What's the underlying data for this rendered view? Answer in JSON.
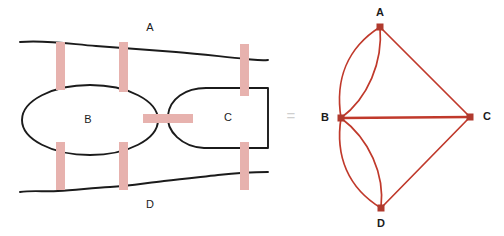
{
  "figure": {
    "equals_symbol": "=",
    "background_color": "#ffffff"
  },
  "map": {
    "name": "konigsberg-land-map",
    "land_color": "#ffffff",
    "shore_color": "#1b1b1b",
    "bridge_color": "#e7b2ae",
    "regions": [
      {
        "id": "A",
        "label": "A",
        "label_x": 150,
        "label_y": 28,
        "kind": "north-bank"
      },
      {
        "id": "B",
        "label": "B",
        "label_x": 88,
        "label_y": 120,
        "kind": "island-ellipse"
      },
      {
        "id": "C",
        "label": "C",
        "label_x": 228,
        "label_y": 118,
        "kind": "east-region"
      },
      {
        "id": "D",
        "label": "D",
        "label_x": 150,
        "label_y": 205,
        "kind": "south-bank"
      }
    ],
    "bridges": [
      {
        "id": "bridge-1",
        "connects": [
          "A",
          "B"
        ],
        "orientation": "vertical",
        "x": 56,
        "y": 42,
        "w": 9,
        "h": 48
      },
      {
        "id": "bridge-2",
        "connects": [
          "A",
          "B"
        ],
        "orientation": "vertical",
        "x": 119,
        "y": 42,
        "w": 9,
        "h": 50
      },
      {
        "id": "bridge-3",
        "connects": [
          "A",
          "C"
        ],
        "orientation": "vertical",
        "x": 240,
        "y": 44,
        "w": 9,
        "h": 52
      },
      {
        "id": "bridge-4",
        "connects": [
          "B",
          "C"
        ],
        "orientation": "horizontal",
        "x": 143,
        "y": 114,
        "w": 50,
        "h": 9
      },
      {
        "id": "bridge-5",
        "connects": [
          "B",
          "D"
        ],
        "orientation": "vertical",
        "x": 56,
        "y": 142,
        "w": 9,
        "h": 48
      },
      {
        "id": "bridge-6",
        "connects": [
          "B",
          "D"
        ],
        "orientation": "vertical",
        "x": 119,
        "y": 142,
        "w": 9,
        "h": 48
      },
      {
        "id": "bridge-7",
        "connects": [
          "C",
          "D"
        ],
        "orientation": "vertical",
        "x": 240,
        "y": 142,
        "w": 9,
        "h": 48
      }
    ]
  },
  "graph": {
    "name": "konigsberg-multigraph",
    "edge_color": "#c0392b",
    "vertex_color": "#b03a2e",
    "vertices": [
      {
        "id": "A",
        "label": "A",
        "x": 380,
        "y": 27,
        "label_x": 380,
        "label_y": 13,
        "degree": 3
      },
      {
        "id": "B",
        "label": "B",
        "x": 341,
        "y": 118,
        "label_x": 325,
        "label_y": 118,
        "degree": 5
      },
      {
        "id": "C",
        "label": "C",
        "x": 470,
        "y": 117,
        "label_x": 487,
        "label_y": 117,
        "degree": 3
      },
      {
        "id": "D",
        "label": "D",
        "x": 381,
        "y": 208,
        "label_x": 381,
        "label_y": 224,
        "degree": 3
      }
    ],
    "edges": [
      {
        "id": "edge-AB-1",
        "from": "A",
        "to": "B",
        "style": "curve",
        "bulge": -16
      },
      {
        "id": "edge-AB-2",
        "from": "A",
        "to": "B",
        "style": "curve",
        "bulge": 14
      },
      {
        "id": "edge-AC",
        "from": "A",
        "to": "C",
        "style": "straight",
        "bulge": 0
      },
      {
        "id": "edge-BC",
        "from": "B",
        "to": "C",
        "style": "straight-thick",
        "bulge": 0
      },
      {
        "id": "edge-BD-1",
        "from": "B",
        "to": "D",
        "style": "curve",
        "bulge": -16
      },
      {
        "id": "edge-BD-2",
        "from": "B",
        "to": "D",
        "style": "curve",
        "bulge": 14
      },
      {
        "id": "edge-CD",
        "from": "C",
        "to": "D",
        "style": "straight",
        "bulge": 0
      }
    ]
  },
  "counts": {
    "bridge_count": 7,
    "region_count": 4,
    "vertex_count": 4,
    "edge_count": 7
  }
}
